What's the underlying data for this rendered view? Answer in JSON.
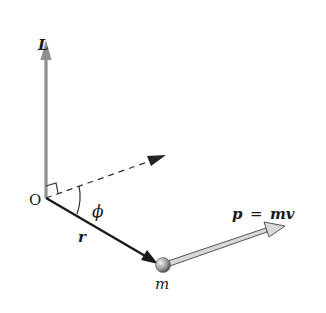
{
  "diagram": {
    "labels": {
      "angular_momentum": "L",
      "origin": "O",
      "angle": "ϕ",
      "position": "r",
      "mass": "m",
      "momentum_p": "p",
      "momentum_eq": "=",
      "momentum_mv": "mv"
    },
    "colors": {
      "L_vector": "#8f8f8f",
      "r_vector": "#1a1a1a",
      "dashed_line": "#333333",
      "p_vector_outline": "#555555",
      "p_vector_fill": "#d8d8d8",
      "mass_light": "#f0f0f0",
      "mass_dark": "#555555",
      "text": "#1a1a1a"
    }
  }
}
